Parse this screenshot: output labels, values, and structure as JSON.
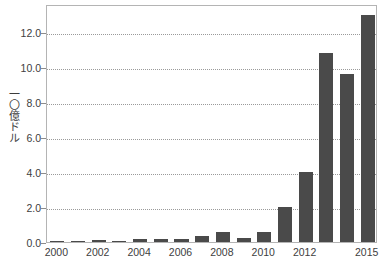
{
  "chart_data": {
    "type": "bar",
    "title": "",
    "subtitle": "",
    "xlabel": "",
    "ylabel": "一〇億ドル",
    "categories": [
      "2000",
      "2001",
      "2002",
      "2003",
      "2004",
      "2005",
      "2006",
      "2007",
      "2008",
      "2009",
      "2010",
      "2011",
      "2012",
      "2013",
      "2014",
      "2015"
    ],
    "values": [
      0.02,
      0.03,
      0.1,
      0.05,
      0.2,
      0.15,
      0.2,
      0.35,
      0.6,
      0.25,
      0.55,
      2.0,
      4.0,
      10.8,
      9.6,
      13.0
    ],
    "series": [
      {
        "name": "",
        "values": [
          0.02,
          0.03,
          0.1,
          0.05,
          0.2,
          0.15,
          0.2,
          0.35,
          0.6,
          0.25,
          0.55,
          2.0,
          4.0,
          10.8,
          9.6,
          13.0
        ]
      }
    ],
    "ylim": [
      0.0,
      13.6
    ],
    "xlim": [
      -0.5,
      15.5
    ],
    "y_ticks": [
      0.0,
      2.0,
      4.0,
      6.0,
      8.0,
      10.0,
      12.0
    ],
    "y_tick_labels": [
      "0.0",
      "2.0",
      "4.0",
      "6.0",
      "8.0",
      "10.0",
      "12.0"
    ],
    "x_tick_categories": [
      "2000",
      "2002",
      "2004",
      "2006",
      "2008",
      "2010",
      "2012",
      "2015"
    ],
    "x_tick_labels": [
      "2000",
      "2002",
      "2004",
      "2006",
      "2008",
      "2010",
      "2012",
      "2015"
    ],
    "grid": true,
    "grid_axis": "y",
    "grid_style": "dotted",
    "legend": false,
    "legend_position": "none",
    "colors": {
      "bar": "#4a4a4a",
      "gridline": "#9a9a9a",
      "frame": "#b4b4b4",
      "text": "#404040",
      "background": "#ffffff"
    }
  }
}
